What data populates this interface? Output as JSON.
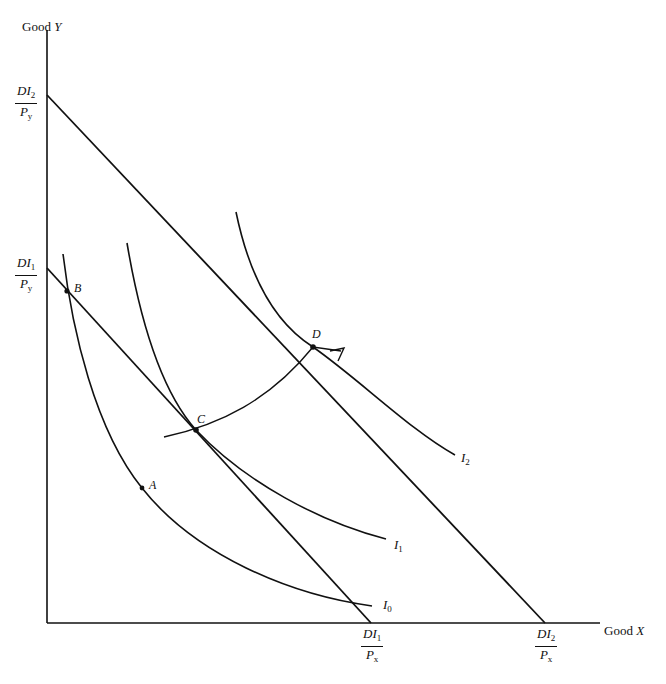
{
  "diagram": {
    "type": "indifference-curve-income-consumption",
    "axes": {
      "y_label": {
        "prefix": "Good ",
        "var": "Y"
      },
      "x_label": {
        "prefix": "Good ",
        "var": "X"
      }
    },
    "intercepts": {
      "y2": {
        "num": "DI",
        "num_sub": "2",
        "den": "P",
        "den_sub": "y"
      },
      "y1": {
        "num": "DI",
        "num_sub": "1",
        "den": "P",
        "den_sub": "y"
      },
      "x1": {
        "num": "DI",
        "num_sub": "1",
        "den": "P",
        "den_sub": "x"
      },
      "x2": {
        "num": "DI",
        "num_sub": "2",
        "den": "P",
        "den_sub": "x"
      }
    },
    "points": {
      "A": "A",
      "B": "B",
      "C": "C",
      "D": "D"
    },
    "curves": {
      "I0": {
        "name": "I",
        "sub": "0"
      },
      "I1": {
        "name": "I",
        "sub": "1"
      },
      "I2": {
        "name": "I",
        "sub": "2"
      }
    },
    "budget_lines": [
      {
        "id": "budget-1",
        "from": "DI1/Py",
        "to": "DI1/Px"
      },
      {
        "id": "budget-2",
        "from": "DI2/Py",
        "to": "DI2/Px"
      }
    ],
    "expansion_path": {
      "through": [
        "C",
        "D"
      ],
      "arrow": true
    },
    "colors": {
      "line": "#111111",
      "background": "#ffffff"
    }
  }
}
